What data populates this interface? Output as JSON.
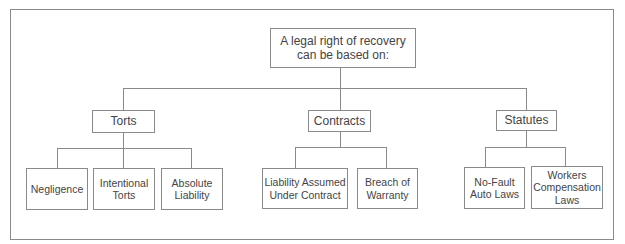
{
  "diagram": {
    "type": "tree",
    "root": {
      "label": "A legal right of recovery\ncan be based on:"
    },
    "branches": [
      {
        "label": "Torts",
        "children": [
          {
            "label": "Negligence"
          },
          {
            "label": "Intentional\nTorts"
          },
          {
            "label": "Absolute\nLiability"
          }
        ]
      },
      {
        "label": "Contracts",
        "children": [
          {
            "label": "Liability Assumed\nUnder Contract"
          },
          {
            "label": "Breach of\nWarranty"
          }
        ]
      },
      {
        "label": "Statutes",
        "children": [
          {
            "label": "No-Fault\nAuto Laws"
          },
          {
            "label": "Workers\nCompensation\nLaws"
          }
        ]
      }
    ],
    "colors": {
      "line": "#8a8a8a",
      "text": "#444444",
      "background": "#ffffff"
    }
  }
}
